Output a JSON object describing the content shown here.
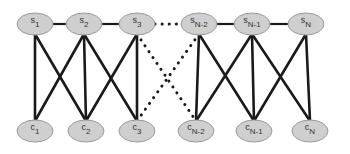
{
  "diagram": {
    "type": "bipartite-graph",
    "top_row": {
      "y": 24,
      "nodes": [
        {
          "id": "s1",
          "letter": "s",
          "sub": "1",
          "x": 35
        },
        {
          "id": "s2",
          "letter": "s",
          "sub": "2",
          "x": 84
        },
        {
          "id": "s3",
          "letter": "s",
          "sub": "3",
          "x": 137
        },
        {
          "id": "sN-2",
          "letter": "s",
          "sub": "N-2",
          "x": 199
        },
        {
          "id": "sN-1",
          "letter": "s",
          "sub": "N-1",
          "x": 252
        },
        {
          "id": "sN",
          "letter": "s",
          "sub": "N",
          "x": 306
        }
      ]
    },
    "bottom_row": {
      "y": 131,
      "nodes": [
        {
          "id": "c1",
          "letter": "c",
          "sub": "1",
          "x": 35
        },
        {
          "id": "c2",
          "letter": "c",
          "sub": "2",
          "x": 86
        },
        {
          "id": "c3",
          "letter": "c",
          "sub": "3",
          "x": 137
        },
        {
          "id": "cN-2",
          "letter": "c",
          "sub": "N-2",
          "x": 196
        },
        {
          "id": "cN-1",
          "letter": "c",
          "sub": "N-1",
          "x": 254
        },
        {
          "id": "cN",
          "letter": "c",
          "sub": "N",
          "x": 310
        }
      ]
    },
    "edges_top_horizontal": [
      {
        "from": "s1",
        "to": "s2",
        "style": "solid"
      },
      {
        "from": "s2",
        "to": "s3",
        "style": "solid"
      },
      {
        "from": "s3",
        "to": "sN-2",
        "style": "dotted"
      },
      {
        "from": "sN-2",
        "to": "sN-1",
        "style": "solid"
      },
      {
        "from": "sN-1",
        "to": "sN",
        "style": "solid"
      }
    ],
    "edges_cross": [
      {
        "from": "s1",
        "to": "c1",
        "style": "solid"
      },
      {
        "from": "s1",
        "to": "c2",
        "style": "solid"
      },
      {
        "from": "s2",
        "to": "c1",
        "style": "solid"
      },
      {
        "from": "s2",
        "to": "c2",
        "style": "solid"
      },
      {
        "from": "s2",
        "to": "c3",
        "style": "solid"
      },
      {
        "from": "s3",
        "to": "c2",
        "style": "solid"
      },
      {
        "from": "s3",
        "to": "c3",
        "style": "solid"
      },
      {
        "from": "s3",
        "to": "cN-2",
        "style": "dotted"
      },
      {
        "from": "sN-2",
        "to": "c3",
        "style": "dotted"
      },
      {
        "from": "sN-2",
        "to": "cN-2",
        "style": "solid"
      },
      {
        "from": "sN-2",
        "to": "cN-1",
        "style": "solid"
      },
      {
        "from": "sN-1",
        "to": "cN-2",
        "style": "solid"
      },
      {
        "from": "sN-1",
        "to": "cN-1",
        "style": "solid"
      },
      {
        "from": "sN-1",
        "to": "cN",
        "style": "solid"
      },
      {
        "from": "sN",
        "to": "cN-1",
        "style": "solid"
      },
      {
        "from": "sN",
        "to": "cN",
        "style": "solid"
      }
    ],
    "colors": {
      "node_fill": "#cfcfcf",
      "node_stroke": "#9a9a9a",
      "edge": "#1a1a1a",
      "background": "#ffffff"
    }
  }
}
